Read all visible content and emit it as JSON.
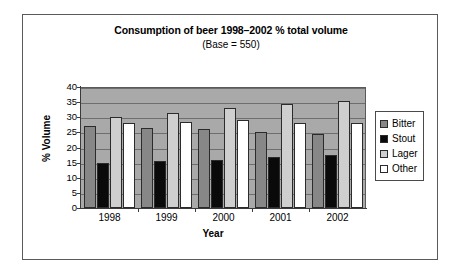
{
  "chart_data": {
    "type": "bar",
    "title": "Consumption of beer 1998–2002 % total volume",
    "subtitle": "(Base = 550)",
    "xlabel": "Year",
    "ylabel": "% Volume",
    "categories": [
      "1998",
      "1999",
      "2000",
      "2001",
      "2002"
    ],
    "ylim": [
      0,
      40
    ],
    "ytick_step": 5,
    "yticks": [
      "40",
      "35",
      "30",
      "25",
      "20",
      "15",
      "10",
      "5",
      "0"
    ],
    "grid": true,
    "legend_position": "right",
    "series": [
      {
        "name": "Bitter",
        "color": "#878787",
        "values": [
          27,
          26.5,
          26,
          25,
          24.5
        ]
      },
      {
        "name": "Stout",
        "color": "#0a0a0a",
        "values": [
          15,
          15.5,
          16,
          17,
          17.5
        ]
      },
      {
        "name": "Lager",
        "color": "#cfcfcf",
        "values": [
          30,
          31.5,
          33,
          34.5,
          35.5
        ]
      },
      {
        "name": "Other",
        "color": "#ffffff",
        "values": [
          28,
          28.5,
          29,
          28,
          28
        ]
      }
    ],
    "plot_background": "#a9a9a9"
  }
}
